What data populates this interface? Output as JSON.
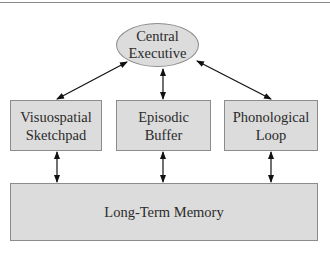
{
  "diagram": {
    "central": {
      "line1": "Central",
      "line2": "Executive"
    },
    "components": [
      {
        "line1": "Visuospatial",
        "line2": "Sketchpad"
      },
      {
        "line1": "Episodic",
        "line2": "Buffer"
      },
      {
        "line1": "Phonological",
        "line2": "Loop"
      }
    ],
    "ltm": {
      "label": "Long-Term Memory"
    },
    "colors": {
      "fill": "#dcdcdc",
      "border": "#8c8c8c",
      "arrow": "#111111"
    }
  }
}
